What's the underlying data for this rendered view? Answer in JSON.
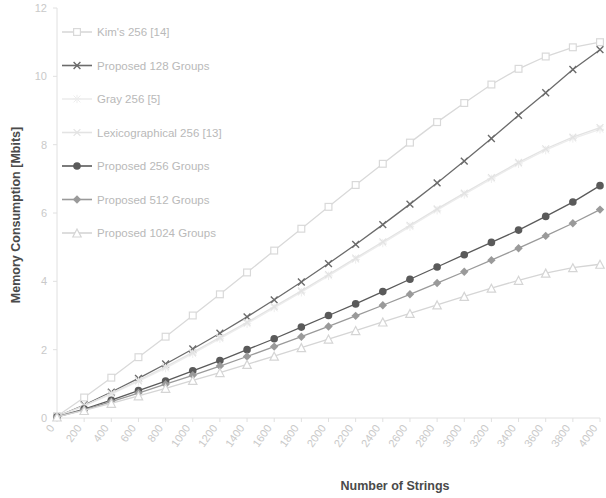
{
  "chart_data": {
    "type": "line",
    "title": "",
    "xlabel": "Number of Strings",
    "ylabel": "Memory Consumption [Mbits]",
    "xlim": [
      0,
      4000
    ],
    "ylim": [
      0,
      12
    ],
    "yticks": [
      "0",
      "2",
      "4",
      "6",
      "8",
      "10",
      "12"
    ],
    "xticks": [
      "0",
      "200",
      "400",
      "600",
      "800",
      "1000",
      "1200",
      "1400",
      "1600",
      "1800",
      "2000",
      "2200",
      "2400",
      "2600",
      "2800",
      "3000",
      "3200",
      "3400",
      "3600",
      "3800",
      "4000"
    ],
    "grid": false,
    "legend_position": "top-left",
    "x": [
      0,
      200,
      400,
      600,
      800,
      1000,
      1200,
      1400,
      1600,
      1800,
      2000,
      2200,
      2400,
      2600,
      2800,
      3000,
      3200,
      3400,
      3600,
      3800,
      4000
    ],
    "series": [
      {
        "name": "Kim's 256 [14]",
        "marker": "square-open",
        "color": "#d9d9d9",
        "values": [
          0.05,
          0.6,
          1.18,
          1.78,
          2.38,
          3.0,
          3.62,
          4.26,
          4.9,
          5.54,
          6.18,
          6.82,
          7.44,
          8.06,
          8.66,
          9.22,
          9.76,
          10.22,
          10.58,
          10.85,
          11.0
        ]
      },
      {
        "name": "Proposed 128 Groups",
        "marker": "cross",
        "color": "#6b6b6b",
        "values": [
          0.04,
          0.38,
          0.76,
          1.16,
          1.58,
          2.02,
          2.48,
          2.96,
          3.46,
          3.98,
          4.52,
          5.08,
          5.66,
          6.26,
          6.88,
          7.52,
          8.18,
          8.86,
          9.52,
          10.2,
          10.78
        ]
      },
      {
        "name": "Gray 256 [5]",
        "marker": "star",
        "color": "#ededed",
        "values": [
          0.04,
          0.35,
          0.7,
          1.07,
          1.46,
          1.88,
          2.32,
          2.76,
          3.22,
          3.68,
          4.16,
          4.64,
          5.12,
          5.6,
          6.08,
          6.54,
          7.0,
          7.44,
          7.84,
          8.18,
          8.45
        ]
      },
      {
        "name": "Lexicographical 256 [13]",
        "marker": "cross-open",
        "color": "#e3e3e3",
        "values": [
          0.04,
          0.36,
          0.72,
          1.1,
          1.5,
          1.92,
          2.36,
          2.8,
          3.26,
          3.72,
          4.2,
          4.68,
          5.16,
          5.64,
          6.12,
          6.58,
          7.04,
          7.48,
          7.88,
          8.22,
          8.5
        ]
      },
      {
        "name": "Proposed 256 Groups",
        "marker": "circle",
        "color": "#5a5a5a",
        "values": [
          0.03,
          0.26,
          0.52,
          0.8,
          1.08,
          1.38,
          1.68,
          2.0,
          2.32,
          2.66,
          3.0,
          3.34,
          3.7,
          4.06,
          4.42,
          4.78,
          5.14,
          5.5,
          5.9,
          6.32,
          6.8
        ]
      },
      {
        "name": "Proposed 512 Groups",
        "marker": "diamond",
        "color": "#9a9a9a",
        "values": [
          0.03,
          0.24,
          0.48,
          0.73,
          0.99,
          1.25,
          1.52,
          1.8,
          2.09,
          2.38,
          2.68,
          2.99,
          3.3,
          3.62,
          3.95,
          4.28,
          4.62,
          4.97,
          5.33,
          5.7,
          6.1
        ]
      },
      {
        "name": "Proposed 1024 Groups",
        "marker": "triangle-open",
        "color": "#d5d5d5",
        "values": [
          0.03,
          0.22,
          0.43,
          0.65,
          0.87,
          1.1,
          1.33,
          1.57,
          1.81,
          2.06,
          2.31,
          2.56,
          2.81,
          3.06,
          3.31,
          3.56,
          3.8,
          4.03,
          4.24,
          4.4,
          4.5
        ]
      }
    ]
  },
  "legend": {
    "items": [
      {
        "label": "Kim's 256 [14]"
      },
      {
        "label": "Proposed 128 Groups"
      },
      {
        "label": "Gray 256 [5]"
      },
      {
        "label": "Lexicographical 256 [13]"
      },
      {
        "label": "Proposed 256 Groups"
      },
      {
        "label": "Proposed 512 Groups"
      },
      {
        "label": "Proposed 1024 Groups"
      }
    ]
  },
  "axes": {
    "y_title": "Memory Consumption [Mbits]",
    "x_title": "Number of Strings"
  }
}
